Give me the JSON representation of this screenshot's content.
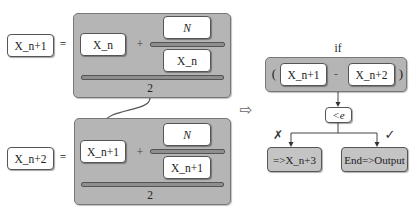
{
  "left_equations": [
    {
      "lhs": "X_n+1",
      "equals": "=",
      "term": "X_n",
      "plus": "+",
      "numerator": "N",
      "denominator": "X_n",
      "divisor": "2"
    },
    {
      "lhs": "X_n+2",
      "equals": "=",
      "term": "X_n+1",
      "plus": "+",
      "numerator": "N",
      "denominator": "X_n+1",
      "divisor": "2"
    }
  ],
  "arrow_symbol": "⇨",
  "condition": {
    "label": "if",
    "open_paren": "(",
    "left": "X_n+1",
    "minus": "-",
    "right": "X_n+2",
    "close_paren": ")",
    "compare": "<e"
  },
  "branches": {
    "false_symbol": "✗",
    "false_result": "=>X_n+3",
    "true_symbol": "✓",
    "true_result": "End=>Output"
  },
  "colors": {
    "panel_gray": "#b5b5b5",
    "result_gray": "#c4c4c4",
    "line": "#444444"
  }
}
